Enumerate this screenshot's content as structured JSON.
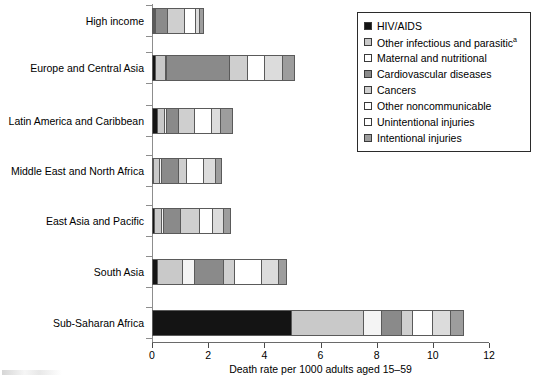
{
  "chart_data": {
    "type": "bar",
    "orientation": "horizontal",
    "stacked": true,
    "title": "",
    "xlabel": "Death rate per 1000 adults aged 15–59",
    "ylabel": "",
    "xlim": [
      0,
      12
    ],
    "xticks": [
      0,
      2,
      4,
      6,
      8,
      10,
      12
    ],
    "xtick_labels": [
      "0",
      "2",
      "4",
      "6",
      "8",
      "10",
      "12"
    ],
    "grid": false,
    "legend_position": "top-right",
    "categories": [
      "High income",
      "Europe and Central Asia",
      "Latin America and Caribbean",
      "Middle East and North Africa",
      "East Asia and Pacific",
      "South Asia",
      "Sub-Saharan Africa"
    ],
    "series": [
      {
        "name": "HIV/AIDS",
        "color": "#141414",
        "values": [
          0.03,
          0.14,
          0.2,
          0.02,
          0.1,
          0.22,
          5.0
        ]
      },
      {
        "name": "Other infectious and parasitic",
        "color": "#c9c9c9",
        "values": [
          0.05,
          0.35,
          0.25,
          0.22,
          0.25,
          0.9,
          2.55
        ]
      },
      {
        "name": "Maternal and nutritional",
        "color": "#f4f4f4",
        "values": [
          0.03,
          0.05,
          0.07,
          0.05,
          0.08,
          0.4,
          0.65
        ]
      },
      {
        "name": "Cardiovascular diseases",
        "color": "#8a8a8a",
        "values": [
          0.4,
          2.25,
          0.45,
          0.62,
          0.6,
          1.05,
          0.7
        ]
      },
      {
        "name": "Cancers",
        "color": "#cfcfcf",
        "values": [
          0.62,
          0.62,
          0.55,
          0.28,
          0.67,
          0.4,
          0.4
        ]
      },
      {
        "name": "Other noncommunicable",
        "color": "#ffffff",
        "values": [
          0.4,
          0.62,
          0.62,
          0.62,
          0.48,
          0.95,
          0.72
        ]
      },
      {
        "name": "Unintentional injuries",
        "color": "#dcdcdc",
        "values": [
          0.12,
          0.62,
          0.32,
          0.42,
          0.4,
          0.62,
          0.62
        ]
      },
      {
        "name": "Intentional injuries",
        "color": "#9d9d9d",
        "values": [
          0.17,
          0.45,
          0.44,
          0.22,
          0.22,
          0.26,
          0.46
        ]
      }
    ],
    "totals": [
      1.82,
      5.1,
      2.9,
      2.45,
      2.8,
      4.8,
      11.1
    ]
  },
  "legend": {
    "items": [
      {
        "label": "HIV/AIDS",
        "suffix": "",
        "color": "#141414"
      },
      {
        "label": "Other infectious and parasitic",
        "suffix": "a",
        "color": "#c9c9c9"
      },
      {
        "label": "Maternal and nutritional",
        "suffix": "",
        "color": "#ffffff"
      },
      {
        "label": "Cardiovascular diseases",
        "suffix": "",
        "color": "#8a8a8a"
      },
      {
        "label": "Cancers",
        "suffix": "",
        "color": "#cfcfcf"
      },
      {
        "label": "Other noncommunicable",
        "suffix": "",
        "color": "#ffffff"
      },
      {
        "label": "Unintentional injuries",
        "suffix": "",
        "color": "#ffffff"
      },
      {
        "label": "Intentional injuries",
        "suffix": "",
        "color": "#9d9d9d"
      }
    ]
  },
  "colors": {
    "axis": "#8d8d8d",
    "bar_outline": "#5a5a5a",
    "text": "#000000",
    "background": "#ffffff"
  }
}
